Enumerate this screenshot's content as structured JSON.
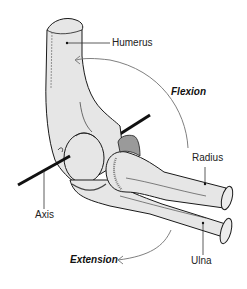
{
  "diagram": {
    "labels": {
      "humerus": "Humerus",
      "flexion": "Flexion",
      "radius": "Radius",
      "axis": "Axis",
      "ulna": "Ulna",
      "extension": "Extension"
    },
    "colors": {
      "bone_fill": "#e6e6e6",
      "outline": "#1a1a1a",
      "arrow": "#808080",
      "axis_rod": "#111111",
      "leader_line": "#333333"
    }
  }
}
